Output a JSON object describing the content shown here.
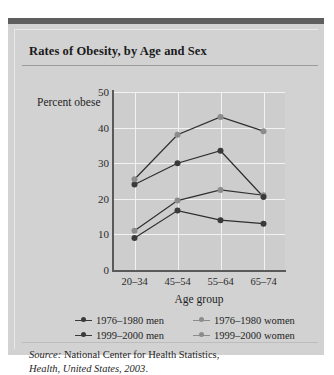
{
  "figure": {
    "title": "Rates of Obesity, by Age and Sex",
    "source_prefix": "Source:",
    "source_text": " National Center for Health Statistics,",
    "source_italic": "Health, United States, 2003",
    "source_suffix": "."
  },
  "chart_data": {
    "type": "line",
    "title": "Rates of Obesity, by Age and Sex",
    "xlabel": "Age group",
    "ylabel": "Percent obese",
    "categories": [
      "20–34",
      "45–54",
      "55–64",
      "65–74"
    ],
    "ylim": [
      0,
      50
    ],
    "yticks": [
      0,
      10,
      20,
      30,
      40,
      50
    ],
    "ytick_labels": [
      "0",
      "10",
      "20",
      "30",
      "40",
      "50"
    ],
    "grid": "horizontal-and-vertical",
    "legend_position": "below",
    "series": [
      {
        "name": "1976–1980 men",
        "values": [
          9,
          16.7,
          14,
          13
        ],
        "color": "#3a3a3a",
        "marker": "circle"
      },
      {
        "name": "1976–1980 women",
        "values": [
          11,
          19.5,
          22.5,
          21
        ],
        "color": "#8c8c8c",
        "marker": "circle"
      },
      {
        "name": "1999–2000 men",
        "values": [
          24,
          30,
          33.5,
          20.5
        ],
        "color": "#3a3a3a",
        "marker": "circle"
      },
      {
        "name": "1999–2000 women",
        "values": [
          25.5,
          38,
          43,
          39
        ],
        "color": "#8c8c8c",
        "marker": "circle"
      }
    ]
  },
  "legend": {
    "rows": [
      [
        {
          "label": "1976–1980 men",
          "color": "#3a3a3a"
        },
        {
          "label": "1976–1980 women",
          "color": "#8c8c8c"
        }
      ],
      [
        {
          "label": "1999–2000 men",
          "color": "#3a3a3a"
        },
        {
          "label": "1999–2000 women",
          "color": "#8c8c8c"
        }
      ]
    ]
  },
  "colors": {
    "panel": "#d2d2d2",
    "plot_bg": "#cdcdcd",
    "gridline": "#f2f2f2",
    "axis": "#5a5a5a",
    "topbar": "#5e5e5e",
    "dark_series": "#3a3a3a",
    "light_series": "#8c8c8c"
  }
}
